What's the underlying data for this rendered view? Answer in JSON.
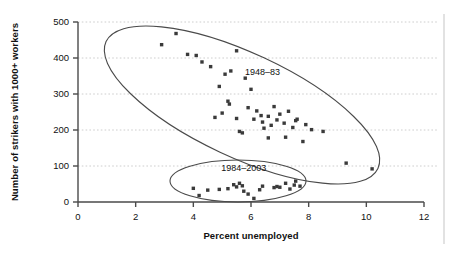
{
  "chart_data": {
    "type": "scatter",
    "title": "",
    "xlabel": "Percent unemployed",
    "ylabel": "Number of strikers with 1000+ workers",
    "xlim": [
      0,
      12
    ],
    "ylim": [
      0,
      500
    ],
    "xticks": [
      0,
      2,
      4,
      6,
      8,
      10,
      12
    ],
    "yticks": [
      0,
      100,
      200,
      300,
      400,
      500
    ],
    "grid": "horizontal-dotted",
    "legend": "none",
    "marker": "square",
    "marker_color": "#3a3a3a",
    "series": [
      {
        "name": "1948–83",
        "points": [
          [
            2.9,
            437
          ],
          [
            3.4,
            468
          ],
          [
            3.8,
            410
          ],
          [
            4.1,
            407
          ],
          [
            4.3,
            389
          ],
          [
            4.6,
            376
          ],
          [
            5.5,
            420
          ],
          [
            5.3,
            364
          ],
          [
            5.1,
            355
          ],
          [
            4.9,
            321
          ],
          [
            5.8,
            344
          ],
          [
            6.0,
            313
          ],
          [
            5.2,
            280
          ],
          [
            5.25,
            272
          ],
          [
            5.0,
            247
          ],
          [
            4.75,
            235
          ],
          [
            5.5,
            232
          ],
          [
            5.9,
            262
          ],
          [
            6.2,
            253
          ],
          [
            6.1,
            230
          ],
          [
            6.35,
            240
          ],
          [
            6.4,
            222
          ],
          [
            6.6,
            238
          ],
          [
            6.7,
            213
          ],
          [
            6.45,
            205
          ],
          [
            6.9,
            228
          ],
          [
            7.0,
            244
          ],
          [
            7.3,
            252
          ],
          [
            7.15,
            219
          ],
          [
            7.45,
            207
          ],
          [
            7.6,
            230
          ],
          [
            7.55,
            226
          ],
          [
            7.9,
            215
          ],
          [
            8.1,
            201
          ],
          [
            7.2,
            180
          ],
          [
            6.6,
            178
          ],
          [
            7.8,
            168
          ],
          [
            8.5,
            196
          ],
          [
            5.6,
            196
          ],
          [
            5.7,
            192
          ],
          [
            6.8,
            265
          ],
          [
            9.3,
            108
          ],
          [
            10.2,
            92
          ]
        ]
      },
      {
        "name": "1984–2003",
        "points": [
          [
            4.0,
            38
          ],
          [
            4.2,
            18
          ],
          [
            4.5,
            33
          ],
          [
            4.9,
            35
          ],
          [
            5.2,
            37
          ],
          [
            5.4,
            48
          ],
          [
            5.5,
            42
          ],
          [
            5.6,
            52
          ],
          [
            5.7,
            45
          ],
          [
            5.75,
            30
          ],
          [
            5.9,
            22
          ],
          [
            6.1,
            10
          ],
          [
            6.3,
            34
          ],
          [
            6.4,
            44
          ],
          [
            6.8,
            40
          ],
          [
            6.9,
            43
          ],
          [
            7.0,
            41
          ],
          [
            7.2,
            52
          ],
          [
            7.35,
            36
          ],
          [
            7.5,
            47
          ],
          [
            7.55,
            58
          ],
          [
            7.7,
            44
          ]
        ]
      }
    ],
    "annotations": [
      {
        "label": "1948–83",
        "type": "ellipse-label",
        "x": 6.4,
        "y": 352
      },
      {
        "label": "1984–2003",
        "type": "ellipse-label",
        "x": 5.75,
        "y": 86
      }
    ],
    "ellipses": [
      {
        "name": "1948-83-ellipse",
        "cx_px": 242,
        "cy_px": 105,
        "rx_px": 150,
        "ry_px": 52,
        "rotation_deg": 25
      },
      {
        "name": "1984-2003-ellipse",
        "cx_px": 238,
        "cy_px": 181,
        "rx_px": 68,
        "ry_px": 21,
        "rotation_deg": 0
      }
    ]
  },
  "axes": {
    "x_title": "Percent unemployed",
    "y_title": "Number of strikers with 1000+ workers",
    "x_tick_labels": [
      "0",
      "2",
      "4",
      "6",
      "8",
      "10",
      "12"
    ],
    "y_tick_labels": [
      "0",
      "100",
      "200",
      "300",
      "400",
      "500"
    ]
  },
  "style": {
    "axis_color": "#4a4a4a",
    "grid_color": "#c8c8c8",
    "marker_color": "#3a3a3a",
    "text_color": "#111111",
    "background": "#ffffff",
    "border_color": "#cfcfcf"
  }
}
